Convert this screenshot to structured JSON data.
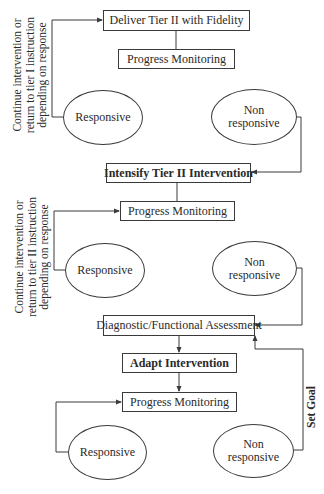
{
  "diagram": {
    "colors": {
      "line": "#3a3a3a",
      "text": "#2a2a2a",
      "background": "#ffffff"
    },
    "section1": {
      "top_box": "Deliver Tier II  with Fidelity",
      "monitor_box": "Progress Monitoring",
      "responsive": "Responsive",
      "nonresponsive_line1": "Non",
      "nonresponsive_line2": "responsive",
      "side_note": [
        "Continue intervention or",
        "return to tier I instruction",
        "depending on response"
      ]
    },
    "section2": {
      "top_box": "Intensify Tier II Intervention",
      "monitor_box": "Progress Monitoring",
      "responsive": "Responsive",
      "nonresponsive_line1": "Non",
      "nonresponsive_line2": "responsive",
      "side_note": [
        "Continue intervention or",
        "return to tier II instruction",
        "depending on response"
      ]
    },
    "section3": {
      "assessment_box": "Diagnostic/Functional Assessment",
      "adapt_box": "Adapt Intervention",
      "monitor_box": "Progress Monitoring",
      "responsive": "Responsive",
      "nonresponsive_line1": "Non",
      "nonresponsive_line2": "responsive",
      "set_goal_label": "Set Goal"
    }
  }
}
